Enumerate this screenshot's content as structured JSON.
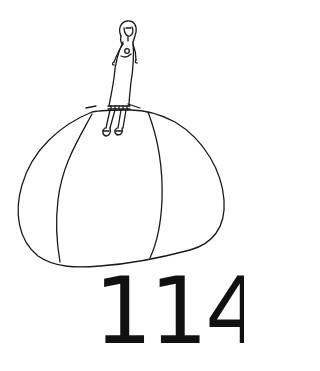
{
  "illustration": {
    "description": "Line drawing of a small girl standing on top of a large round rock/ball",
    "stroke_color": "#1a1a1a",
    "background_color": "#ffffff",
    "subjects": [
      "girl-figure",
      "large-round-rock"
    ]
  },
  "page": {
    "number": "114",
    "number_color": "#111111"
  }
}
